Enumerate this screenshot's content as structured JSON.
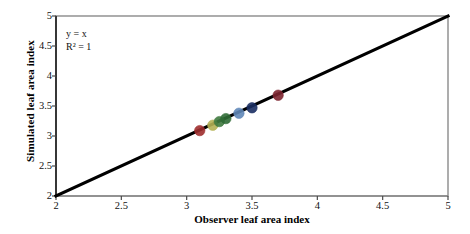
{
  "chart_data": {
    "type": "scatter",
    "title": "",
    "xlabel": "Observer leaf area index",
    "ylabel": "Simulated leaf area index",
    "xlim": [
      2,
      5
    ],
    "ylim": [
      2,
      5
    ],
    "xticks": [
      "2",
      "2.5",
      "3",
      "3.5",
      "4",
      "4.5",
      "5"
    ],
    "yticks": [
      "2",
      "2.5",
      "3",
      "3.5",
      "4",
      "4.5",
      "5"
    ],
    "xtick_values": [
      2,
      2.5,
      3,
      3.5,
      4,
      4.5,
      5
    ],
    "ytick_values": [
      2,
      2.5,
      3,
      3.5,
      4,
      4.5,
      5
    ],
    "grid": false,
    "legend": "none",
    "annotations": [
      {
        "text": "y = x",
        "x": 2.3,
        "y": 4.6
      },
      {
        "text": "R² = 1",
        "x": 2.3,
        "y": 4.42
      }
    ],
    "reference_line": {
      "label": "y = x",
      "from": [
        2,
        2
      ],
      "to": [
        5,
        5
      ],
      "color": "#000000",
      "width": 3
    },
    "points": [
      {
        "x": 3.1,
        "y": 3.09,
        "color": "#9e2d2d"
      },
      {
        "x": 3.2,
        "y": 3.18,
        "color": "#b5b154"
      },
      {
        "x": 3.25,
        "y": 3.24,
        "color": "#3f7a3f"
      },
      {
        "x": 3.3,
        "y": 3.29,
        "color": "#2f6b35"
      },
      {
        "x": 3.4,
        "y": 3.38,
        "color": "#5f87b8"
      },
      {
        "x": 3.5,
        "y": 3.47,
        "color": "#1b2f63"
      },
      {
        "x": 3.7,
        "y": 3.68,
        "color": "#7d2530"
      }
    ],
    "series_name": "observed vs simulated LAI",
    "axes": {
      "frame_color": "#808080",
      "axis_color": "#4a4a4a",
      "background": "#ffffff"
    }
  },
  "colors": {
    "line": "#000000",
    "frame": "#8a8a8a",
    "text": "#111111",
    "background": "#ffffff"
  }
}
